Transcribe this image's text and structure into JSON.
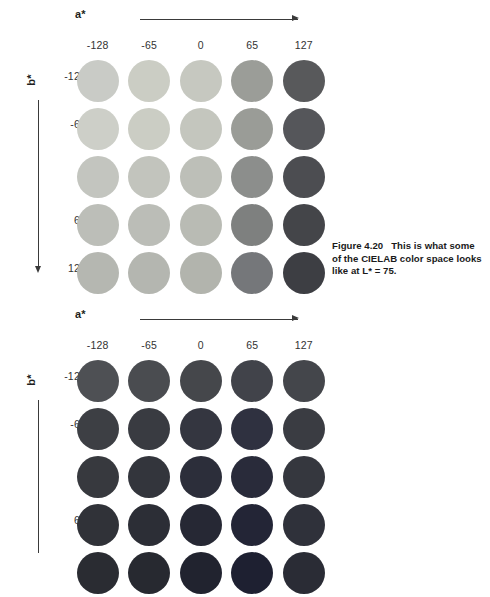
{
  "page": {
    "background": "#ffffff",
    "width": 490,
    "height": 553
  },
  "figures": [
    {
      "id": "figure-4-20",
      "axis_a": {
        "label": "a*",
        "direction": "right",
        "ticks": [
          "-128",
          "-65",
          "0",
          "65",
          "127"
        ]
      },
      "axis_b": {
        "label": "b*",
        "direction": "down",
        "ticks": [
          "-128",
          "-65",
          "0",
          "65",
          "127"
        ]
      },
      "caption": {
        "number": "Figure 4.20",
        "text": "This is what some of the CIELAB color space looks like at L* = 75."
      },
      "visible": true
    },
    {
      "id": "figure-4-21",
      "axis_a": {
        "label": "a*",
        "direction": "right",
        "ticks": [
          "-128",
          "-65",
          "0",
          "65",
          "127"
        ]
      },
      "axis_b": {
        "label": "b*",
        "direction": "down",
        "ticks": [
          "-128",
          "-65",
          "0",
          "65",
          "127"
        ]
      },
      "caption": null,
      "visible": true
    }
  ],
  "chart_data": [
    {
      "type": "heatmap",
      "title": "CIELAB color space at L* = 75",
      "xlabel": "a*",
      "ylabel": "b*",
      "x": [
        -128,
        -65,
        0,
        65,
        127
      ],
      "y": [
        -128,
        -65,
        0,
        65,
        127
      ],
      "grid": false,
      "legend": "none",
      "marker": "circle",
      "colors": [
        [
          "#c9cbc6",
          "#cbcdc4",
          "#c6c8c0",
          "#9b9d98",
          "#58595b"
        ],
        [
          "#cdcfc8",
          "#cbcdc4",
          "#c4c6be",
          "#9a9c97",
          "#55565a"
        ],
        [
          "#c3c5bf",
          "#c2c4bd",
          "#bdbfb8",
          "#8c8e8c",
          "#4c4d51"
        ],
        [
          "#bcbeb8",
          "#bbbdb7",
          "#b9bbb4",
          "#7e807f",
          "#444549"
        ],
        [
          "#b5b7b1",
          "#b4b6b0",
          "#b2b4ad",
          "#75777a",
          "#3d3e43"
        ]
      ]
    },
    {
      "type": "heatmap",
      "title": "CIELAB color space (lower L*)",
      "xlabel": "a*",
      "ylabel": "b*",
      "x": [
        -128,
        -65,
        0,
        65,
        127
      ],
      "y": [
        -128,
        -65,
        0,
        65,
        127
      ],
      "grid": false,
      "legend": "none",
      "marker": "circle",
      "colors": [
        [
          "#4e5054",
          "#4a4c50",
          "#45474b",
          "#41434a",
          "#44464b"
        ],
        [
          "#3d3f44",
          "#393b41",
          "#343640",
          "#2f3140",
          "#3a3c42"
        ],
        [
          "#37393e",
          "#33353c",
          "#2c2e3a",
          "#292b3a",
          "#35373e"
        ],
        [
          "#303238",
          "#2c2e36",
          "#262834",
          "#232536",
          "#2f313a"
        ],
        [
          "#2a2c32",
          "#272930",
          "#21232f",
          "#1e2031",
          "#2a2c35"
        ]
      ]
    }
  ]
}
